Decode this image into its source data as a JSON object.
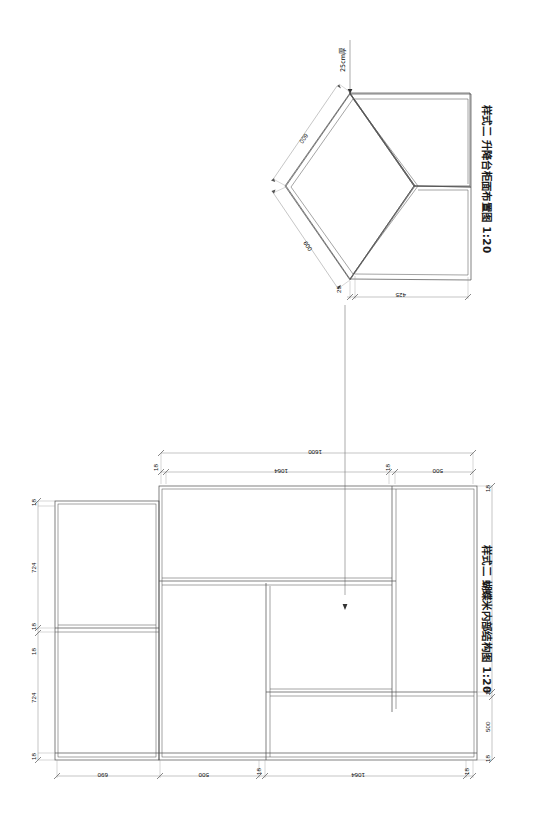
{
  "drawing": {
    "background": "#ffffff",
    "line_color": "#4a4a4a",
    "dim_color": "#808080",
    "page_width": 543,
    "page_height": 820
  },
  "views": [
    {
      "id": "top-view",
      "title": "样式二  升降台柜面布置图  1:20",
      "scale": "1:20",
      "type": "isometric-hexagon",
      "note_label": "25cm厚",
      "dimensions": [
        {
          "name": "upper-left-edge",
          "value": "600"
        },
        {
          "name": "lower-left-edge",
          "value": "600"
        },
        {
          "name": "bottom-thickness",
          "value": "25"
        },
        {
          "name": "bottom-edge",
          "value": "425"
        }
      ]
    },
    {
      "id": "structure-view",
      "title": "样式二  蝴蝶米内部结构图  1:20",
      "scale": "1:20",
      "type": "elevation-internal-structure",
      "overall_width": "1600",
      "dimensions_top": [
        "1600",
        "18",
        "1064",
        "18",
        "500"
      ],
      "dimensions_left": [
        "18",
        "724",
        "18",
        "18",
        "724",
        "18"
      ],
      "dimensions_right": [
        "18",
        "1064",
        "18",
        "500",
        "18"
      ],
      "dimensions_bottom": [
        "690",
        "500",
        "18",
        "1064",
        "18"
      ],
      "panel_thickness": "18"
    }
  ],
  "labels": {
    "d_1600": "1600",
    "d_1064": "1064",
    "d_724": "724",
    "d_690": "690",
    "d_600": "600",
    "d_500": "500",
    "d_425": "425",
    "d_25": "25",
    "d_18": "18",
    "note_25cm": "25cm厚",
    "title_top": "样式二  升降台柜面布置图  1:20",
    "title_bottom": "样式二  蝴蝶米内部结构图  1:20"
  }
}
